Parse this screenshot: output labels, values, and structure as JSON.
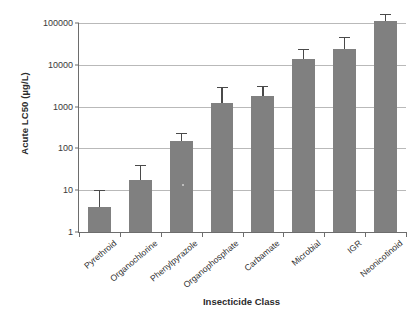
{
  "chart_data": {
    "type": "bar",
    "title": "",
    "xlabel": "Insecticide Class",
    "ylabel": "Acute LC50 (µg/L)",
    "yscale": "log",
    "ylim": [
      1,
      100000
    ],
    "ytick_labels": [
      "100000",
      "10000",
      "1000",
      "100",
      "10",
      "1"
    ],
    "ytick_values": [
      100000,
      10000,
      1000,
      100,
      10,
      1
    ],
    "grid": "horizontal",
    "legend": "none",
    "bar_color": "#808080",
    "error_color": "#4a4a4a",
    "categories": [
      "Pyrethroid",
      "Organochlorine",
      "Phenylpyrazole",
      "Organophosphate",
      "Carbamate",
      "Microbial",
      "IGR",
      "Neonicotinoid"
    ],
    "values": [
      4,
      18,
      150,
      1200,
      1800,
      14000,
      24000,
      110000
    ],
    "error_upper": [
      10,
      40,
      230,
      3000,
      3100,
      24000,
      45000,
      160000
    ],
    "series": [
      {
        "name": "Acute LC50",
        "values": [
          4,
          18,
          150,
          1200,
          1800,
          14000,
          24000,
          110000
        ],
        "error_upper": [
          10,
          40,
          230,
          3000,
          3100,
          24000,
          45000,
          160000
        ]
      }
    ]
  }
}
